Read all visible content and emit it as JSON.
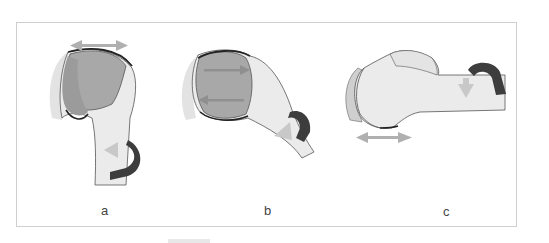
{
  "figure": {
    "panels": [
      {
        "id": "a",
        "label": "a",
        "description": "Humeral head, anterior view, external rotation arrow around shaft, horizontal double arrow above head"
      },
      {
        "id": "b",
        "label": "b",
        "description": "Humeral head tilted view with double arrows across articular surface and rotation arrow on shaft"
      },
      {
        "id": "c",
        "label": "c",
        "description": "Humerus horizontal view, rotation arrow on shaft, horizontal double arrow below head"
      }
    ],
    "colors": {
      "bone_fill": "#ebebeb",
      "shadow_fill": "#dcdcdc",
      "articular_fill": "#a9a9a9",
      "articular_dark": "#9a9a9a",
      "outline": "#444444",
      "rotation_arrow": "#3d3d3d",
      "direction_arrow": "#b5b5b5",
      "frame_border": "#cfcfcf"
    }
  }
}
